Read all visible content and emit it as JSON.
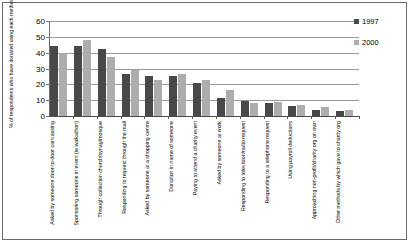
{
  "chart_data": {
    "type": "bar",
    "title": "",
    "xlabel": "",
    "ylabel": "% of respondents who have donated using each method",
    "ylim": [
      0,
      60
    ],
    "yticks": [
      0,
      10,
      20,
      30,
      40,
      50,
      60
    ],
    "grid": true,
    "legend_position": "right",
    "categories": [
      "Asked by someone door-to-door canvassing",
      "Sponsoring someone in event (ie walkathon)",
      "Through collection church/synag/mosque",
      "Responding to request through the mail",
      "Asked by someone at a shopping centre",
      "Donation in name of someone",
      "Paying to attend a charity event",
      "Asked by someone at work",
      "Responding to television/radio request",
      "Responding to a telephone request",
      "Using payroll deductions",
      "Approaching non-profit/charity org on own",
      "Other methods by which gave to charity org"
    ],
    "series": [
      {
        "name": "1997",
        "color": "#484848",
        "values": [
          44,
          44,
          42.5,
          26.5,
          25,
          25,
          21,
          11.5,
          9.5,
          8.5,
          6.5,
          4,
          3
        ]
      },
      {
        "name": "2000",
        "color": "#adadad",
        "values": [
          40,
          48,
          37.5,
          29,
          22.5,
          26.5,
          23,
          16.5,
          8,
          9,
          7,
          5.5,
          3.5
        ]
      }
    ]
  }
}
